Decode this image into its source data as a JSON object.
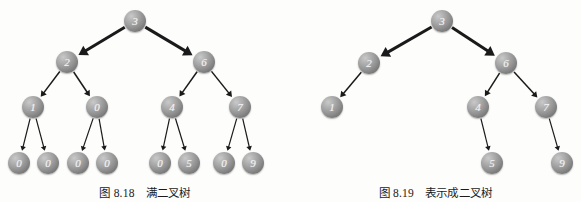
{
  "page": {
    "background": "#fdfdfc",
    "node_fill_light": "#c9c9c9",
    "node_fill_dark": "#5e5e5e",
    "node_label_color": "#f2f2f2",
    "edge_color": "#1a1a1a"
  },
  "figures": [
    {
      "id": "full-binary-tree",
      "caption": "图 8.18　满二叉树",
      "tree_type": "full-binary-tree",
      "nodes": [
        {
          "id": "n0",
          "value": "3",
          "x": 135,
          "y": 21,
          "level": 1
        },
        {
          "id": "n1",
          "value": "2",
          "x": 67,
          "y": 62,
          "level": 2
        },
        {
          "id": "n2",
          "value": "6",
          "x": 204,
          "y": 62,
          "level": 2
        },
        {
          "id": "n3",
          "value": "1",
          "x": 33,
          "y": 107,
          "level": 3
        },
        {
          "id": "n4",
          "value": "0",
          "x": 97,
          "y": 107,
          "level": 3
        },
        {
          "id": "n5",
          "value": "4",
          "x": 172,
          "y": 107,
          "level": 3
        },
        {
          "id": "n6",
          "value": "7",
          "x": 240,
          "y": 107,
          "level": 3
        },
        {
          "id": "n7",
          "value": "0",
          "x": 19,
          "y": 163,
          "level": 4
        },
        {
          "id": "n8",
          "value": "0",
          "x": 48,
          "y": 163,
          "level": 4
        },
        {
          "id": "n9",
          "value": "0",
          "x": 78,
          "y": 163,
          "level": 4
        },
        {
          "id": "n10",
          "value": "0",
          "x": 107,
          "y": 163,
          "level": 4
        },
        {
          "id": "n11",
          "value": "0",
          "x": 160,
          "y": 163,
          "level": 4
        },
        {
          "id": "n12",
          "value": "5",
          "x": 189,
          "y": 163,
          "level": 4
        },
        {
          "id": "n13",
          "value": "0",
          "x": 224,
          "y": 163,
          "level": 4
        },
        {
          "id": "n14",
          "value": "9",
          "x": 253,
          "y": 163,
          "level": 4
        }
      ],
      "edges": [
        {
          "from": "n0",
          "to": "n1",
          "weight": "thick"
        },
        {
          "from": "n0",
          "to": "n2",
          "weight": "thick"
        },
        {
          "from": "n1",
          "to": "n3",
          "weight": "medium"
        },
        {
          "from": "n1",
          "to": "n4",
          "weight": "medium"
        },
        {
          "from": "n2",
          "to": "n5",
          "weight": "medium"
        },
        {
          "from": "n2",
          "to": "n6",
          "weight": "medium"
        },
        {
          "from": "n3",
          "to": "n7",
          "weight": "thin"
        },
        {
          "from": "n3",
          "to": "n8",
          "weight": "thin"
        },
        {
          "from": "n4",
          "to": "n9",
          "weight": "thin"
        },
        {
          "from": "n4",
          "to": "n10",
          "weight": "thin"
        },
        {
          "from": "n5",
          "to": "n11",
          "weight": "thin"
        },
        {
          "from": "n5",
          "to": "n12",
          "weight": "thin"
        },
        {
          "from": "n6",
          "to": "n13",
          "weight": "thin"
        },
        {
          "from": "n6",
          "to": "n14",
          "weight": "thin"
        }
      ]
    },
    {
      "id": "as-binary-tree",
      "caption": "图 8.19　表示成二叉树",
      "tree_type": "binary-tree-representation",
      "nodes": [
        {
          "id": "m0",
          "value": "3",
          "x": 152,
          "y": 21,
          "level": 1
        },
        {
          "id": "m1",
          "value": "2",
          "x": 79,
          "y": 63,
          "level": 2
        },
        {
          "id": "m2",
          "value": "6",
          "x": 216,
          "y": 63,
          "level": 2
        },
        {
          "id": "m3",
          "value": "1",
          "x": 42,
          "y": 107,
          "level": 3
        },
        {
          "id": "m4",
          "value": "4",
          "x": 188,
          "y": 107,
          "level": 3
        },
        {
          "id": "m5",
          "value": "7",
          "x": 256,
          "y": 107,
          "level": 3
        },
        {
          "id": "m6",
          "value": "5",
          "x": 202,
          "y": 163,
          "level": 4
        },
        {
          "id": "m7",
          "value": "9",
          "x": 272,
          "y": 163,
          "level": 4
        }
      ],
      "edges": [
        {
          "from": "m0",
          "to": "m1",
          "weight": "thick"
        },
        {
          "from": "m0",
          "to": "m2",
          "weight": "thick"
        },
        {
          "from": "m1",
          "to": "m3",
          "weight": "medium"
        },
        {
          "from": "m2",
          "to": "m4",
          "weight": "medium"
        },
        {
          "from": "m2",
          "to": "m5",
          "weight": "medium"
        },
        {
          "from": "m4",
          "to": "m6",
          "weight": "thin"
        },
        {
          "from": "m5",
          "to": "m7",
          "weight": "thin"
        }
      ]
    }
  ]
}
